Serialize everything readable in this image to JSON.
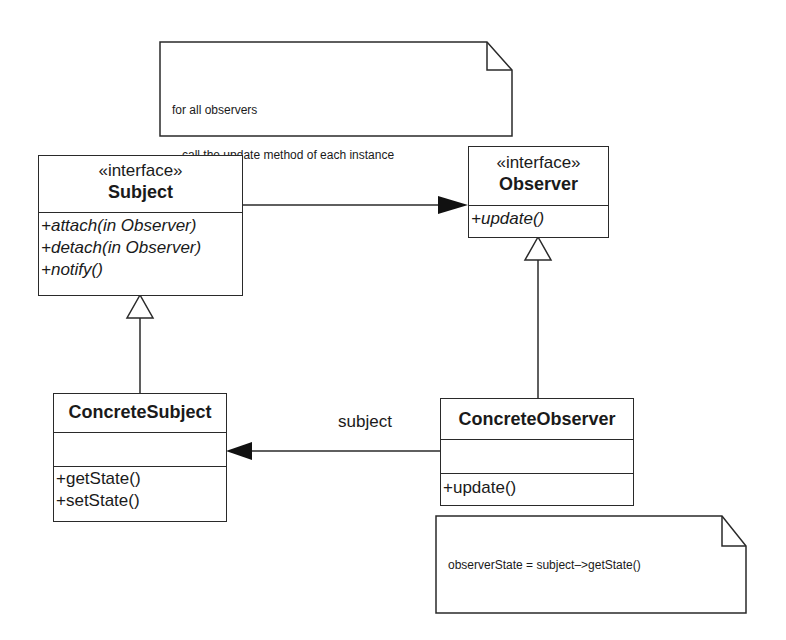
{
  "diagram": {
    "notes": {
      "top": {
        "line1": "for all observers",
        "line2": "call the update method of each instance"
      },
      "bottom": {
        "text": "observerState = subject–>getState()"
      }
    },
    "classes": {
      "subject": {
        "stereotype": "«interface»",
        "name": "Subject",
        "operations": [
          "+attach(in Observer)",
          "+detach(in Observer)",
          "+notify()"
        ]
      },
      "observer": {
        "stereotype": "«interface»",
        "name": "Observer",
        "operations": [
          "+update()"
        ]
      },
      "concrete_subject": {
        "name": "ConcreteSubject",
        "operations": [
          "+getState()",
          "+setState()"
        ]
      },
      "concrete_observer": {
        "name": "ConcreteObserver",
        "operations": [
          "+update()"
        ]
      }
    },
    "associations": {
      "observer_to_subject_label": "subject"
    },
    "colors": {
      "line": "#2a2a2a",
      "background": "#ffffff",
      "text": "#1a1a1a"
    }
  }
}
